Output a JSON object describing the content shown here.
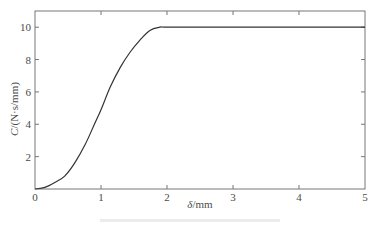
{
  "chart_data": {
    "type": "line",
    "title": "",
    "xlabel": "δ/mm",
    "ylabel": "C/(N·s/mm)",
    "xlim": [
      0,
      5
    ],
    "ylim": [
      0,
      11
    ],
    "xticks": [
      0,
      1,
      2,
      3,
      4,
      5
    ],
    "yticks": [
      0,
      2,
      4,
      6,
      8,
      10
    ],
    "grid": false,
    "legend": null,
    "series": [
      {
        "name": "C",
        "color": "#333333",
        "x": [
          0,
          0.15,
          0.3,
          0.45,
          0.6,
          0.76,
          0.9,
          1.0,
          1.14,
          1.29,
          1.44,
          1.59,
          1.74,
          1.89,
          2.0,
          2.5,
          3.0,
          3.5,
          4.0,
          4.5,
          5.0
        ],
        "y": [
          0,
          0.1,
          0.4,
          0.8,
          1.6,
          2.75,
          4.0,
          4.9,
          6.3,
          7.5,
          8.45,
          9.2,
          9.8,
          10.0,
          10.0,
          10.0,
          10.0,
          10.0,
          10.0,
          10.0,
          10.0
        ]
      }
    ]
  },
  "axes": {
    "x_label_symbol": "δ",
    "x_label_unit": "/mm",
    "y_label_symbol": "C",
    "y_label_unit": "/(N·s/mm)"
  }
}
